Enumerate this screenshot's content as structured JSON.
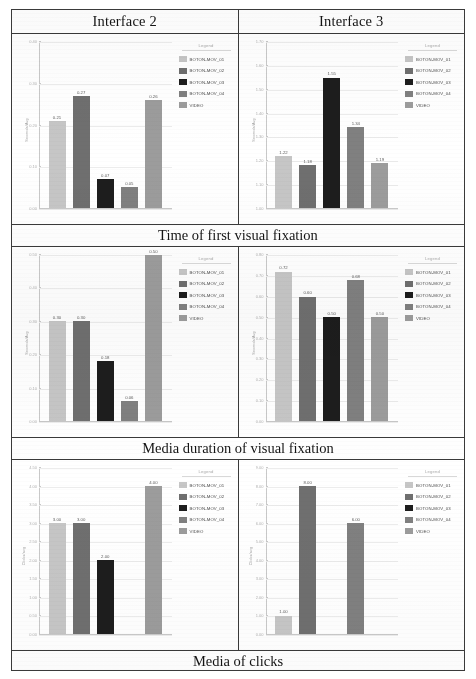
{
  "headers": {
    "left": "Interface 2",
    "right": "Interface 3"
  },
  "captions": {
    "row1": "Time of first visual fixation",
    "row2": "Media duration of visual fixation",
    "row3": "Media of clicks"
  },
  "legend": {
    "title": "Legend",
    "items": [
      {
        "label": "BOTON-MOV_01",
        "color": "#c6c6c6"
      },
      {
        "label": "BOTON-MOV_02",
        "color": "#6f6f6f"
      },
      {
        "label": "BOTON-MOV_03",
        "color": "#1d1d1d"
      },
      {
        "label": "BOTON-MOV_04",
        "color": "#808080"
      },
      {
        "label": "VIDEO",
        "color": "#9c9c9c"
      }
    ]
  },
  "chart_data": [
    {
      "id": "r1c1",
      "type": "bar",
      "title": "Interface 2 - Time of first visual fixation",
      "xlabel": "",
      "ylabel": "Seconds/Avg",
      "categories": [
        "BOTON-MOV_01",
        "BOTON-MOV_02",
        "BOTON-MOV_03",
        "BOTON-MOV_04",
        "VIDEO"
      ],
      "values": [
        0.21,
        0.27,
        0.07,
        0.05,
        0.26
      ],
      "value_labels": [
        "0.21",
        "0.27",
        "0.07",
        "0.05",
        "0.26"
      ],
      "colors": [
        "#c6c6c6",
        "#6f6f6f",
        "#1d1d1d",
        "#808080",
        "#9c9c9c"
      ],
      "ylim": [
        0.0,
        0.4
      ],
      "yticks": [
        0.4,
        0.3,
        0.2,
        0.1,
        0.0
      ],
      "ytick_labels": [
        "0.40",
        "0.30",
        "0.20",
        "0.10",
        "0.00"
      ],
      "grid": true,
      "legend_position": "right"
    },
    {
      "id": "r1c2",
      "type": "bar",
      "title": "Interface 3 - Time of first visual fixation",
      "xlabel": "",
      "ylabel": "Seconds/Avg",
      "categories": [
        "BOTON-MOV_01",
        "BOTON-MOV_02",
        "BOTON-MOV_03",
        "BOTON-MOV_04",
        "VIDEO"
      ],
      "values": [
        1.22,
        1.18,
        1.55,
        1.34,
        1.19
      ],
      "value_labels": [
        "1.22",
        "1.18",
        "1.55",
        "1.34",
        "1.19"
      ],
      "colors": [
        "#c6c6c6",
        "#6f6f6f",
        "#1d1d1d",
        "#808080",
        "#9c9c9c"
      ],
      "ylim": [
        1.0,
        1.7
      ],
      "yticks": [
        1.7,
        1.6,
        1.5,
        1.4,
        1.3,
        1.2,
        1.1,
        1.0
      ],
      "ytick_labels": [
        "1.70",
        "1.60",
        "1.50",
        "1.40",
        "1.30",
        "1.20",
        "1.10",
        "1.00"
      ],
      "grid": true,
      "legend_position": "right"
    },
    {
      "id": "r2c1",
      "type": "bar",
      "title": "Interface 2 - Media duration of visual fixation",
      "xlabel": "",
      "ylabel": "Seconds/Avg",
      "categories": [
        "BOTON-MOV_01",
        "BOTON-MOV_02",
        "BOTON-MOV_03",
        "BOTON-MOV_04",
        "VIDEO"
      ],
      "values": [
        0.3,
        0.3,
        0.18,
        0.06,
        0.5
      ],
      "value_labels": [
        "0.30",
        "0.30",
        "0.18",
        "0.06",
        "0.50"
      ],
      "colors": [
        "#c6c6c6",
        "#6f6f6f",
        "#1d1d1d",
        "#808080",
        "#9c9c9c"
      ],
      "ylim": [
        0.0,
        0.5
      ],
      "yticks": [
        0.5,
        0.4,
        0.3,
        0.2,
        0.1,
        0.0
      ],
      "ytick_labels": [
        "0.50",
        "0.40",
        "0.30",
        "0.20",
        "0.10",
        "0.00"
      ],
      "grid": true,
      "legend_position": "right"
    },
    {
      "id": "r2c2",
      "type": "bar",
      "title": "Interface 3 - Media duration of visual fixation",
      "xlabel": "",
      "ylabel": "Seconds/Avg",
      "categories": [
        "BOTON-MOV_01",
        "BOTON-MOV_02",
        "BOTON-MOV_03",
        "BOTON-MOV_04",
        "VIDEO"
      ],
      "values": [
        0.72,
        0.6,
        0.5,
        0.68,
        0.5
      ],
      "value_labels": [
        "0.72",
        "0.60",
        "0.50",
        "0.68",
        "0.50"
      ],
      "colors": [
        "#c6c6c6",
        "#6f6f6f",
        "#1d1d1d",
        "#808080",
        "#9c9c9c"
      ],
      "ylim": [
        0.0,
        0.8
      ],
      "yticks": [
        0.8,
        0.7,
        0.6,
        0.5,
        0.4,
        0.3,
        0.2,
        0.1,
        0.0
      ],
      "ytick_labels": [
        "0.80",
        "0.70",
        "0.60",
        "0.50",
        "0.40",
        "0.30",
        "0.20",
        "0.10",
        "0.00"
      ],
      "grid": true,
      "legend_position": "right"
    },
    {
      "id": "r3c1",
      "type": "bar",
      "title": "Interface 2 - Media of clicks",
      "xlabel": "",
      "ylabel": "Clicks/avg",
      "categories": [
        "BOTON-MOV_01",
        "BOTON-MOV_02",
        "BOTON-MOV_03",
        "BOTON-MOV_04",
        "VIDEO"
      ],
      "values": [
        3.0,
        3.0,
        2.0,
        0.0,
        4.0
      ],
      "value_labels": [
        "3.00",
        "3.00",
        "2.00",
        "",
        "4.00"
      ],
      "colors": [
        "#c6c6c6",
        "#6f6f6f",
        "#1d1d1d",
        "#808080",
        "#9c9c9c"
      ],
      "ylim": [
        0.0,
        4.5
      ],
      "yticks": [
        4.5,
        4.0,
        3.5,
        3.0,
        2.5,
        2.0,
        1.5,
        1.0,
        0.5,
        0.0
      ],
      "ytick_labels": [
        "4.50",
        "4.00",
        "3.50",
        "3.00",
        "2.50",
        "2.00",
        "1.50",
        "1.00",
        "0.50",
        "0.00"
      ],
      "grid": true,
      "legend_position": "right"
    },
    {
      "id": "r3c2",
      "type": "bar",
      "title": "Interface 3 - Media of clicks",
      "xlabel": "",
      "ylabel": "Clicks/avg",
      "categories": [
        "BOTON-MOV_01",
        "BOTON-MOV_02",
        "BOTON-MOV_03",
        "BOTON-MOV_04",
        "VIDEO"
      ],
      "values": [
        1.0,
        8.0,
        0.0,
        6.0,
        0.0
      ],
      "value_labels": [
        "1.00",
        "8.00",
        "",
        "6.00",
        ""
      ],
      "colors": [
        "#c6c6c6",
        "#6f6f6f",
        "#1d1d1d",
        "#808080",
        "#9c9c9c"
      ],
      "ylim": [
        0.0,
        9.0
      ],
      "yticks": [
        9.0,
        8.0,
        7.0,
        6.0,
        5.0,
        4.0,
        3.0,
        2.0,
        1.0,
        0.0
      ],
      "ytick_labels": [
        "9.00",
        "8.00",
        "7.00",
        "6.00",
        "5.00",
        "4.00",
        "3.00",
        "2.00",
        "1.00",
        "0.00"
      ],
      "grid": true,
      "legend_position": "right"
    }
  ]
}
